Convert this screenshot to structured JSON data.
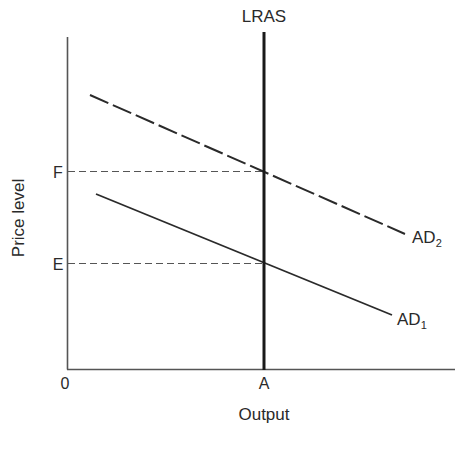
{
  "diagram": {
    "title": "",
    "axes": {
      "x_label": "Output",
      "y_label": "Price level",
      "origin_label": "0",
      "x_tick_label": "A",
      "y_tick_labels": [
        "F",
        "E"
      ]
    },
    "curves": [
      {
        "id": "lras",
        "label": "LRAS",
        "style": "solid-thick"
      },
      {
        "id": "ad2",
        "label": "AD",
        "subscript": "2",
        "style": "dashed"
      },
      {
        "id": "ad1",
        "label": "AD",
        "subscript": "1",
        "style": "solid"
      }
    ],
    "guides": [
      {
        "id": "f-guide",
        "label": "F",
        "style": "dashed"
      },
      {
        "id": "e-guide",
        "label": "E",
        "style": "dashed"
      }
    ],
    "colors": {
      "ink": "#2a2a2a",
      "background": "#ffffff"
    }
  }
}
